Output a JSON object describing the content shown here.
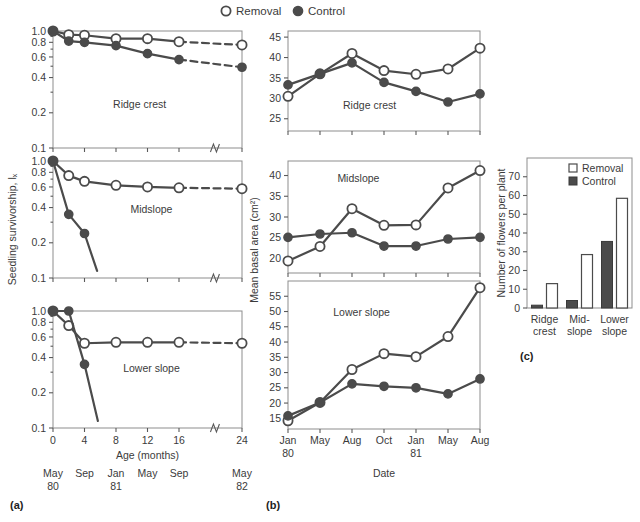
{
  "legend": {
    "removal_label": "Removal",
    "control_label": "Control",
    "removal_marker": "open-circle-icon",
    "control_marker": "filled-circle-icon"
  },
  "panels": {
    "a": {
      "part_label": "(a)",
      "ylabel": "Seedling survivorship, lₓ",
      "xlabel": "Age (months)",
      "yticks": [
        "1.0",
        "0.8",
        "0.6",
        "0.4",
        "0.2",
        "0.1"
      ],
      "ytickvals": [
        1.0,
        0.8,
        0.6,
        0.4,
        0.2,
        0.1
      ],
      "xticks": [
        "0",
        "4",
        "8",
        "12",
        "16",
        "24"
      ],
      "xtickvals": [
        0,
        4,
        8,
        12,
        16,
        24
      ],
      "axis_break": true,
      "date_axis": [
        {
          "top": "May",
          "bottom": "80",
          "x": 0
        },
        {
          "top": "Sep",
          "bottom": "",
          "x": 4
        },
        {
          "top": "Jan",
          "bottom": "81",
          "x": 8
        },
        {
          "top": "May",
          "bottom": "",
          "x": 12
        },
        {
          "top": "Sep",
          "bottom": "",
          "x": 16
        },
        {
          "top": "May",
          "bottom": "82",
          "x": 24
        }
      ],
      "subpanels": [
        {
          "title": "Ridge crest",
          "title_x": 11.0,
          "title_y": 0.22,
          "series": [
            {
              "name": "Removal",
              "marker": "open",
              "x": [
                0,
                2,
                4,
                8,
                12,
                16,
                24
              ],
              "y": [
                1.0,
                0.93,
                0.92,
                0.86,
                0.86,
                0.81,
                0.76
              ],
              "dash_from": 5
            },
            {
              "name": "Control",
              "marker": "closed",
              "x": [
                0,
                2,
                4,
                8,
                12,
                16,
                24
              ],
              "y": [
                1.0,
                0.82,
                0.8,
                0.75,
                0.64,
                0.57,
                0.49
              ],
              "dash_from": 5
            }
          ]
        },
        {
          "title": "Midslope",
          "title_x": 12.5,
          "title_y": 0.36,
          "series": [
            {
              "name": "Removal",
              "marker": "open",
              "x": [
                0,
                2,
                4,
                8,
                12,
                16,
                24
              ],
              "y": [
                1.0,
                0.75,
                0.67,
                0.62,
                0.6,
                0.59,
                0.58
              ],
              "dash_from": 5
            },
            {
              "name": "Control",
              "marker": "closed",
              "x": [
                0,
                2,
                4,
                5.6
              ],
              "y": [
                1.0,
                0.35,
                0.24,
                0.115
              ],
              "last_unmarked": true
            }
          ]
        },
        {
          "title": "Lower slope",
          "title_x": 12.5,
          "title_y": 0.3,
          "series": [
            {
              "name": "Removal",
              "marker": "open",
              "x": [
                0,
                2,
                4,
                8,
                12,
                16,
                24
              ],
              "y": [
                1.0,
                0.75,
                0.53,
                0.54,
                0.54,
                0.54,
                0.53
              ],
              "dash_from": 5
            },
            {
              "name": "Control",
              "marker": "closed",
              "x": [
                0,
                2,
                4,
                5.7
              ],
              "y": [
                1.0,
                1.0,
                0.35,
                0.115
              ],
              "last_unmarked": true
            }
          ]
        }
      ]
    },
    "b": {
      "part_label": "(b)",
      "ylabel": "Mean basal area (cm²)",
      "xlabel": "Date",
      "xticks": [
        "Jan",
        "May",
        "Aug",
        "Oct",
        "Jan",
        "May",
        "Aug"
      ],
      "xtick_years": [
        "80",
        "",
        "",
        "",
        "81",
        "",
        ""
      ],
      "subpanels": [
        {
          "title": "Ridge crest",
          "title_x": 2.55,
          "title_y": 27.5,
          "yticks": [
            "45",
            "40",
            "35",
            "30",
            "25"
          ],
          "ytickvals": [
            45,
            40,
            35,
            30,
            25
          ],
          "ylim": [
            22.0,
            46.5
          ],
          "series": [
            {
              "name": "Removal",
              "marker": "open",
              "x": [
                0,
                1,
                2,
                3,
                4,
                5,
                6
              ],
              "y": [
                30.5,
                36.0,
                41.0,
                36.8,
                35.9,
                37.2,
                42.3
              ]
            },
            {
              "name": "Control",
              "marker": "closed",
              "x": [
                0,
                1,
                2,
                3,
                4,
                5,
                6
              ],
              "y": [
                33.3,
                36.0,
                38.7,
                33.9,
                31.7,
                29.1,
                31.1
              ]
            }
          ]
        },
        {
          "title": "Midslope",
          "title_x": 2.2,
          "title_y": 38.5,
          "yticks": [
            "40",
            "35",
            "30",
            "25",
            "20"
          ],
          "ytickvals": [
            40,
            35,
            30,
            25,
            20
          ],
          "ylim": [
            16.5,
            43.5
          ],
          "series": [
            {
              "name": "Removal",
              "marker": "open",
              "x": [
                0,
                1,
                2,
                3,
                4,
                5,
                6
              ],
              "y": [
                19.4,
                22.9,
                32.0,
                28.0,
                28.1,
                37.0,
                41.2
              ]
            },
            {
              "name": "Control",
              "marker": "closed",
              "x": [
                0,
                1,
                2,
                3,
                4,
                5,
                6
              ],
              "y": [
                25.1,
                25.9,
                26.2,
                23.0,
                23.0,
                24.7,
                25.1
              ]
            }
          ]
        },
        {
          "title": "Lower slope",
          "title_x": 2.3,
          "title_y": 48.5,
          "yticks": [
            "55",
            "50",
            "45",
            "40",
            "35",
            "30",
            "25",
            "20",
            "15"
          ],
          "ytickvals": [
            55,
            50,
            45,
            40,
            35,
            30,
            25,
            20,
            15
          ],
          "ylim": [
            11.5,
            60.0
          ],
          "series": [
            {
              "name": "Removal",
              "marker": "open",
              "x": [
                0,
                1,
                2,
                3,
                4,
                5,
                6
              ],
              "y": [
                14.2,
                20.2,
                31.0,
                36.2,
                35.2,
                41.8,
                57.8
              ]
            },
            {
              "name": "Control",
              "marker": "closed",
              "x": [
                0,
                1,
                2,
                3,
                4,
                5,
                6
              ],
              "y": [
                15.8,
                20.2,
                26.3,
                25.5,
                25.0,
                23.0,
                27.9
              ]
            }
          ]
        }
      ]
    },
    "c": {
      "part_label": "(c)",
      "ylabel": "Number of flowers per plant",
      "yticks": [
        "70",
        "60",
        "50",
        "40",
        "30",
        "20",
        "10",
        "0"
      ],
      "ytickvals": [
        70,
        60,
        50,
        40,
        30,
        20,
        10,
        0
      ],
      "ylim": [
        0,
        80
      ],
      "legend": {
        "removal_label": "Removal",
        "control_label": "Control"
      },
      "categories": [
        {
          "line1": "Ridge",
          "line2": "crest"
        },
        {
          "line1": "Mid-",
          "line2": "slope"
        },
        {
          "line1": "Lower",
          "line2": "slope"
        }
      ],
      "control_values": [
        1.5,
        4.0,
        35.5
      ],
      "removal_values": [
        13.0,
        28.5,
        58.5
      ]
    }
  },
  "chart_data": [
    {
      "type": "line",
      "title": "Seedling survivorship by topographic position (a)",
      "xlabel": "Age (months)",
      "ylabel": "Seedling survivorship, lx",
      "yscale": "log",
      "ylim": [
        0.1,
        1.0
      ],
      "xlim": [
        0,
        24
      ],
      "grid": false,
      "legend": [
        "Removal",
        "Control"
      ],
      "subplots": [
        {
          "panel": "Ridge crest",
          "x": [
            0,
            2,
            4,
            8,
            12,
            16,
            24
          ],
          "series": [
            {
              "name": "Removal",
              "values": [
                1.0,
                0.93,
                0.92,
                0.86,
                0.86,
                0.81,
                0.76
              ]
            },
            {
              "name": "Control",
              "values": [
                1.0,
                0.82,
                0.8,
                0.75,
                0.64,
                0.57,
                0.49
              ]
            }
          ]
        },
        {
          "panel": "Midslope",
          "x": [
            0,
            2,
            4,
            8,
            12,
            16,
            24
          ],
          "series": [
            {
              "name": "Removal",
              "values": [
                1.0,
                0.75,
                0.67,
                0.62,
                0.6,
                0.59,
                0.58
              ]
            },
            {
              "name": "Control",
              "values": [
                1.0,
                0.35,
                0.24,
                null,
                null,
                null,
                null
              ]
            }
          ]
        },
        {
          "panel": "Lower slope",
          "x": [
            0,
            2,
            4,
            8,
            12,
            16,
            24
          ],
          "series": [
            {
              "name": "Removal",
              "values": [
                1.0,
                0.75,
                0.53,
                0.54,
                0.54,
                0.54,
                0.53
              ]
            },
            {
              "name": "Control",
              "values": [
                1.0,
                1.0,
                0.35,
                null,
                null,
                null,
                null
              ]
            }
          ]
        }
      ]
    },
    {
      "type": "line",
      "title": "Mean basal area by topographic position (b)",
      "xlabel": "Date",
      "ylabel": "Mean basal area (cm2)",
      "grid": false,
      "legend": [
        "Removal",
        "Control"
      ],
      "categories": [
        "Jan 80",
        "May",
        "Aug",
        "Oct",
        "Jan 81",
        "May",
        "Aug"
      ],
      "subplots": [
        {
          "panel": "Ridge crest",
          "ylim": [
            22,
            46.5
          ],
          "series": [
            {
              "name": "Removal",
              "values": [
                30.5,
                36.0,
                41.0,
                36.8,
                35.9,
                37.2,
                42.3
              ]
            },
            {
              "name": "Control",
              "values": [
                33.3,
                36.0,
                38.7,
                33.9,
                31.7,
                29.1,
                31.1
              ]
            }
          ]
        },
        {
          "panel": "Midslope",
          "ylim": [
            16.5,
            43.5
          ],
          "series": [
            {
              "name": "Removal",
              "values": [
                19.4,
                22.9,
                32.0,
                28.0,
                28.1,
                37.0,
                41.2
              ]
            },
            {
              "name": "Control",
              "values": [
                25.1,
                25.9,
                26.2,
                23.0,
                23.0,
                24.7,
                25.1
              ]
            }
          ]
        },
        {
          "panel": "Lower slope",
          "ylim": [
            11.5,
            60.0
          ],
          "series": [
            {
              "name": "Removal",
              "values": [
                14.2,
                20.2,
                31.0,
                36.2,
                35.2,
                41.8,
                57.8
              ]
            },
            {
              "name": "Control",
              "values": [
                15.8,
                20.2,
                26.3,
                25.5,
                25.0,
                23.0,
                27.9
              ]
            }
          ]
        }
      ]
    },
    {
      "type": "bar",
      "title": "Number of flowers per plant (c)",
      "xlabel": "",
      "ylabel": "Number of flowers per plant",
      "ylim": [
        0,
        80
      ],
      "grid": false,
      "categories": [
        "Ridge crest",
        "Mid-slope",
        "Lower slope"
      ],
      "series": [
        {
          "name": "Control",
          "values": [
            1.5,
            4.0,
            35.5
          ]
        },
        {
          "name": "Removal",
          "values": [
            13.0,
            28.5,
            58.5
          ]
        }
      ]
    }
  ]
}
